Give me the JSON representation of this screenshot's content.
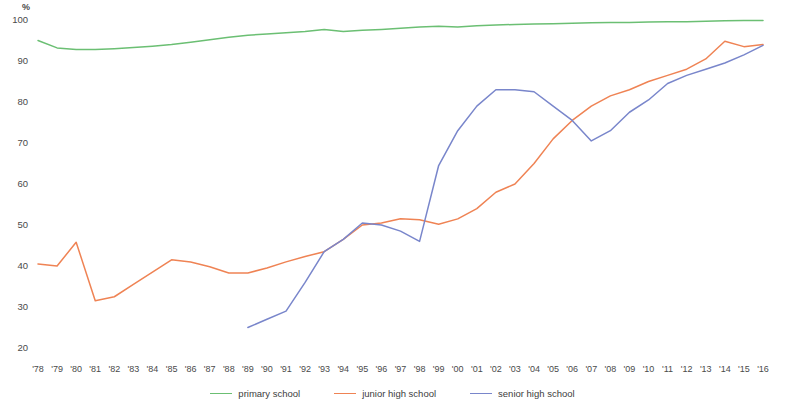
{
  "axis": {
    "unit_label": "%",
    "y_ticks": [
      100,
      90,
      80,
      70,
      60,
      50,
      40,
      30,
      20
    ],
    "x_ticks": [
      "'78",
      "'79",
      "'80",
      "'81",
      "'82",
      "'83",
      "'84",
      "'85",
      "'86",
      "'87",
      "'88",
      "'89",
      "'90",
      "'91",
      "'92",
      "'93",
      "'94",
      "'95",
      "'96",
      "'97",
      "'98",
      "'99",
      "'00",
      "'01",
      "'02",
      "'03",
      "'04",
      "'05",
      "'06",
      "'07",
      "'08",
      "'09",
      "'10",
      "'11",
      "'12",
      "'13",
      "'14",
      "'15",
      "'16"
    ]
  },
  "legend": {
    "items": [
      {
        "label": "primary school",
        "color": "#6bbf73"
      },
      {
        "label": "junior high school",
        "color": "#ef8354"
      },
      {
        "label": "senior high school",
        "color": "#7986cb"
      }
    ]
  },
  "chart_data": {
    "type": "line",
    "title": "",
    "xlabel": "",
    "ylabel": "%",
    "ylim": [
      20,
      100
    ],
    "grid": false,
    "legend_position": "bottom-center",
    "x": [
      "'78",
      "'79",
      "'80",
      "'81",
      "'82",
      "'83",
      "'84",
      "'85",
      "'86",
      "'87",
      "'88",
      "'89",
      "'90",
      "'91",
      "'92",
      "'93",
      "'94",
      "'95",
      "'96",
      "'97",
      "'98",
      "'99",
      "'00",
      "'01",
      "'02",
      "'03",
      "'04",
      "'05",
      "'06",
      "'07",
      "'08",
      "'09",
      "'10",
      "'11",
      "'12",
      "'13",
      "'14",
      "'15",
      "'16"
    ],
    "series": [
      {
        "name": "primary school",
        "color": "#6bbf73",
        "values": [
          95.0,
          93.2,
          92.8,
          92.8,
          93.0,
          93.3,
          93.6,
          94.0,
          94.6,
          95.2,
          95.8,
          96.3,
          96.6,
          96.9,
          97.2,
          97.7,
          97.2,
          97.5,
          97.7,
          98.0,
          98.3,
          98.5,
          98.3,
          98.6,
          98.8,
          98.9,
          99.0,
          99.1,
          99.2,
          99.3,
          99.4,
          99.4,
          99.5,
          99.6,
          99.6,
          99.7,
          99.8,
          99.9,
          99.9
        ]
      },
      {
        "name": "junior high school",
        "color": "#ef8354",
        "values": [
          40.5,
          40.0,
          45.8,
          31.5,
          32.5,
          35.5,
          38.5,
          41.5,
          41.0,
          39.8,
          38.3,
          38.3,
          39.5,
          41.0,
          42.3,
          43.5,
          46.5,
          50.0,
          50.5,
          51.5,
          51.3,
          50.2,
          51.5,
          54.0,
          58.0,
          60.0,
          65.0,
          71.0,
          75.5,
          79.0,
          81.5,
          83.0,
          85.0,
          86.5,
          88.0,
          90.5,
          94.8,
          93.5,
          94.0
        ]
      },
      {
        "name": "senior high school",
        "color": "#7986cb",
        "values": [
          null,
          null,
          null,
          null,
          null,
          null,
          null,
          null,
          null,
          null,
          null,
          25.0,
          27.0,
          29.0,
          36.0,
          43.5,
          46.5,
          50.5,
          50.0,
          48.5,
          46.0,
          64.5,
          73.0,
          79.0,
          83.0,
          83.0,
          82.5,
          79.0,
          75.5,
          70.5,
          73.0,
          77.5,
          80.5,
          84.5,
          86.5,
          88.0,
          89.5,
          91.5,
          93.8
        ]
      }
    ]
  },
  "plot_geometry": {
    "left": 38,
    "right": 763,
    "top_value": 100,
    "top_y": 20,
    "bottom_value": 20,
    "bottom_y": 348
  }
}
